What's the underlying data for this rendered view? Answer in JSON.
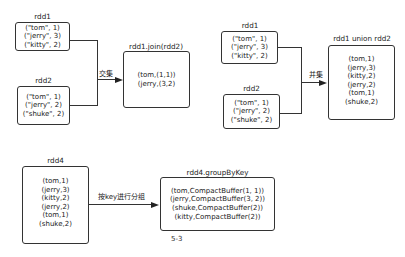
{
  "join_section": {
    "rdd1": {
      "title": "rdd1",
      "rows": [
        "(\"tom\", 1)",
        "(\"jerry\", 3)",
        "(\"kitty\", 2)"
      ]
    },
    "rdd2": {
      "title": "rdd2",
      "rows": [
        "(\"tom\", 1)",
        "(\"jerry\", 2)",
        "(\"shuke\", 2)"
      ]
    },
    "edge_label": "交集",
    "result": {
      "title": "rdd1.join(rdd2)",
      "rows": [
        "(tom,(1,1))",
        "(jerry,(3,2)"
      ]
    }
  },
  "union_section": {
    "rdd1": {
      "title": "rdd1",
      "rows": [
        "(\"tom\", 1)",
        "(\"jerry\", 3)",
        "(\"kitty\", 2)"
      ]
    },
    "rdd2": {
      "title": "rdd2",
      "rows": [
        "(\"tom\", 1)",
        "(\"jerry\", 2)",
        "(\"shuke\", 2)"
      ]
    },
    "edge_label": "并集",
    "result": {
      "title": "rdd1 union rdd2",
      "rows": [
        "(tom,1)",
        "(jerry,3)",
        "(kitty,2)",
        "(jerry,2)",
        "(tom,1)",
        "(shuke,2)"
      ]
    }
  },
  "group_section": {
    "rdd4": {
      "title": "rdd4",
      "rows": [
        "(tom,1)",
        "(jerry,3)",
        "(kitty,2)",
        "(jerry,2)",
        "(tom,1)",
        "(shuke,2)"
      ]
    },
    "edge_label": "按key进行分组",
    "result": {
      "title": "rdd4.groupByKey",
      "rows": [
        "(tom,CompactBuffer(1, 1))",
        "(jerry,CompactBuffer(3, 2))",
        "(shuke,CompactBuffer(2))",
        "(kitty,CompactBuffer(2))"
      ]
    }
  },
  "caption": "5-3"
}
